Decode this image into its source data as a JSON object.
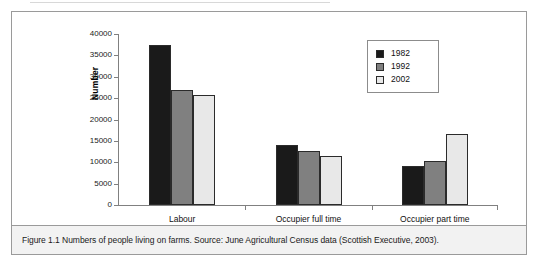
{
  "figure": {
    "caption": "Figure 1.1  Numbers of people living on farms.  Source: June Agricultural Census data (Scottish Executive, 2003)."
  },
  "legend": {
    "position": "top-right",
    "entries": [
      {
        "label": "1982",
        "color": "#1a1a1a"
      },
      {
        "label": "1992",
        "color": "#808080"
      },
      {
        "label": "2002",
        "color": "#e8e8e8"
      }
    ]
  },
  "axis": {
    "y_title": "Number",
    "y_ticks": [
      "40000",
      "35000",
      "30000",
      "25000",
      "20000",
      "15000",
      "10000",
      "5000",
      "0"
    ]
  },
  "chart_data": {
    "type": "bar",
    "title": "",
    "subtitle": "",
    "xlabel": "",
    "ylabel": "Number",
    "ylim": [
      0,
      40000
    ],
    "ytick_step": 5000,
    "grid": false,
    "legend_position": "top-right",
    "categories": [
      "Labour",
      "Occupier full time",
      "Occupier part time"
    ],
    "series": [
      {
        "name": "1982",
        "color": "#1a1a1a",
        "values": [
          37500,
          14100,
          9100
        ]
      },
      {
        "name": "1992",
        "color": "#808080",
        "values": [
          26900,
          12600,
          10200
        ]
      },
      {
        "name": "2002",
        "color": "#e8e8e8",
        "values": [
          25800,
          11400,
          16700
        ]
      }
    ]
  }
}
